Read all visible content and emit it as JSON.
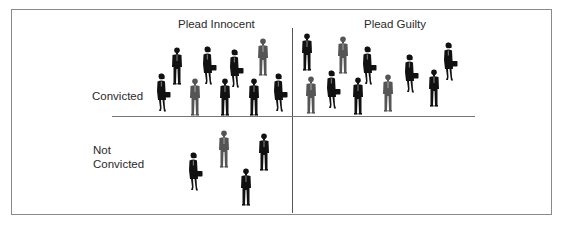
{
  "diagram": {
    "type": "2x2 matrix of people figures",
    "columns": [
      {
        "label": "Plead Innocent"
      },
      {
        "label": "Plead Guilty"
      }
    ],
    "rows": [
      {
        "label": "Convicted"
      },
      {
        "label_line1": "Not",
        "label_line2": "Convicted"
      }
    ],
    "cells": {
      "innocent_convicted": {
        "count": 9
      },
      "guilty_convicted": {
        "count": 10
      },
      "innocent_not_convicted": {
        "count": 4
      },
      "guilty_not_convicted": {
        "count": 0
      }
    },
    "figure_colors": {
      "black": "#111111",
      "gray": "#555555"
    },
    "figures": [
      {
        "cell": "innocent_convicted",
        "kind": "woman",
        "color": "black",
        "x": 156,
        "y": 73
      },
      {
        "cell": "innocent_convicted",
        "kind": "man",
        "color": "black",
        "x": 171,
        "y": 47
      },
      {
        "cell": "innocent_convicted",
        "kind": "man",
        "color": "gray",
        "x": 189,
        "y": 78
      },
      {
        "cell": "innocent_convicted",
        "kind": "woman",
        "color": "black",
        "x": 202,
        "y": 46
      },
      {
        "cell": "innocent_convicted",
        "kind": "man",
        "color": "black",
        "x": 219,
        "y": 78
      },
      {
        "cell": "innocent_convicted",
        "kind": "woman",
        "color": "black",
        "x": 229,
        "y": 49
      },
      {
        "cell": "innocent_convicted",
        "kind": "man",
        "color": "black",
        "x": 248,
        "y": 78
      },
      {
        "cell": "innocent_convicted",
        "kind": "man",
        "color": "gray",
        "x": 257,
        "y": 38
      },
      {
        "cell": "innocent_convicted",
        "kind": "woman",
        "color": "black",
        "x": 273,
        "y": 73
      },
      {
        "cell": "guilty_convicted",
        "kind": "man",
        "color": "black",
        "x": 301,
        "y": 33
      },
      {
        "cell": "guilty_convicted",
        "kind": "man",
        "color": "gray",
        "x": 337,
        "y": 36
      },
      {
        "cell": "guilty_convicted",
        "kind": "woman",
        "color": "black",
        "x": 362,
        "y": 46
      },
      {
        "cell": "guilty_convicted",
        "kind": "woman",
        "color": "black",
        "x": 404,
        "y": 54
      },
      {
        "cell": "guilty_convicted",
        "kind": "woman",
        "color": "black",
        "x": 443,
        "y": 42
      },
      {
        "cell": "guilty_convicted",
        "kind": "man",
        "color": "gray",
        "x": 305,
        "y": 76
      },
      {
        "cell": "guilty_convicted",
        "kind": "woman",
        "color": "black",
        "x": 326,
        "y": 70
      },
      {
        "cell": "guilty_convicted",
        "kind": "man",
        "color": "black",
        "x": 352,
        "y": 77
      },
      {
        "cell": "guilty_convicted",
        "kind": "man",
        "color": "gray",
        "x": 382,
        "y": 74
      },
      {
        "cell": "guilty_convicted",
        "kind": "man",
        "color": "black",
        "x": 428,
        "y": 69
      },
      {
        "cell": "innocent_not_convicted",
        "kind": "woman",
        "color": "black",
        "x": 188,
        "y": 152
      },
      {
        "cell": "innocent_not_convicted",
        "kind": "man",
        "color": "gray",
        "x": 218,
        "y": 130
      },
      {
        "cell": "innocent_not_convicted",
        "kind": "man",
        "color": "black",
        "x": 258,
        "y": 133
      },
      {
        "cell": "innocent_not_convicted",
        "kind": "man",
        "color": "black",
        "x": 240,
        "y": 168
      }
    ]
  }
}
